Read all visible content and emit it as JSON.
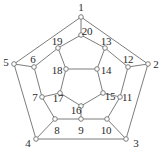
{
  "figure": {
    "name": "dodecahedron-graph",
    "type": "planar-graph-diagram",
    "width": 161,
    "height": 149,
    "background_color": "#ffffff",
    "edge_color": "#6e6e6e",
    "node_fill_color": "#ffffff",
    "node_stroke_color": "#6e6e6e",
    "label_color": "#2b2b2b"
  },
  "nodes": [
    {
      "id": "1",
      "label": "1",
      "x": 81.0,
      "y": 17.0,
      "lx": 81.0,
      "ly": 7.0
    },
    {
      "id": "2",
      "label": "2",
      "x": 148.0,
      "y": 64.0,
      "lx": 156.0,
      "ly": 64.0
    },
    {
      "id": "3",
      "label": "3",
      "x": 126.0,
      "y": 139.0,
      "lx": 136.0,
      "ly": 143.0
    },
    {
      "id": "4",
      "label": "4",
      "x": 36.0,
      "y": 139.0,
      "lx": 28.0,
      "ly": 143.0
    },
    {
      "id": "5",
      "label": "5",
      "x": 14.0,
      "y": 64.0,
      "lx": 6.0,
      "ly": 62.0
    },
    {
      "id": "6",
      "label": "6",
      "x": 34.0,
      "y": 67.0,
      "lx": 33.0,
      "ly": 59.0
    },
    {
      "id": "7",
      "label": "7",
      "x": 42.0,
      "y": 97.0,
      "lx": 35.0,
      "ly": 97.0
    },
    {
      "id": "8",
      "label": "8",
      "x": 55.0,
      "y": 119.0,
      "lx": 57.0,
      "ly": 130.0
    },
    {
      "id": "9",
      "label": "9",
      "x": 81.0,
      "y": 119.0,
      "lx": 81.0,
      "ly": 130.0
    },
    {
      "id": "10",
      "label": "10",
      "x": 107.0,
      "y": 119.0,
      "lx": 106.0,
      "ly": 130.0
    },
    {
      "id": "11",
      "label": "11",
      "x": 120.0,
      "y": 97.0,
      "lx": 127.0,
      "ly": 97.0
    },
    {
      "id": "12",
      "label": "12",
      "x": 128.0,
      "y": 67.0,
      "lx": 128.0,
      "ly": 59.0
    },
    {
      "id": "13",
      "label": "13",
      "x": 105.0,
      "y": 48.0,
      "lx": 106.0,
      "ly": 41.0
    },
    {
      "id": "14",
      "label": "14",
      "x": 97.0,
      "y": 69.0,
      "lx": 106.0,
      "ly": 70.0
    },
    {
      "id": "15",
      "label": "15",
      "x": 103.0,
      "y": 93.0,
      "lx": 110.0,
      "ly": 96.0
    },
    {
      "id": "16",
      "label": "16",
      "x": 81.0,
      "y": 106.0,
      "lx": 76.0,
      "ly": 110.0
    },
    {
      "id": "17",
      "label": "17",
      "x": 60.0,
      "y": 93.0,
      "lx": 58.0,
      "ly": 98.0
    },
    {
      "id": "18",
      "label": "18",
      "x": 66.0,
      "y": 69.0,
      "lx": 57.0,
      "ly": 70.0
    },
    {
      "id": "19",
      "label": "19",
      "x": 58.0,
      "y": 48.0,
      "lx": 57.0,
      "ly": 41.0
    },
    {
      "id": "20",
      "label": "20",
      "x": 81.0,
      "y": 35.0,
      "lx": 87.0,
      "ly": 31.0
    }
  ],
  "edges": [
    {
      "from": "1",
      "to": "5"
    },
    {
      "from": "1",
      "to": "2"
    },
    {
      "from": "1",
      "to": "20"
    },
    {
      "from": "2",
      "to": "3"
    },
    {
      "from": "2",
      "to": "12"
    },
    {
      "from": "3",
      "to": "4"
    },
    {
      "from": "3",
      "to": "10"
    },
    {
      "from": "4",
      "to": "5"
    },
    {
      "from": "4",
      "to": "8"
    },
    {
      "from": "5",
      "to": "6"
    },
    {
      "from": "6",
      "to": "7"
    },
    {
      "from": "6",
      "to": "19"
    },
    {
      "from": "7",
      "to": "8"
    },
    {
      "from": "7",
      "to": "17"
    },
    {
      "from": "8",
      "to": "9"
    },
    {
      "from": "9",
      "to": "10"
    },
    {
      "from": "9",
      "to": "16"
    },
    {
      "from": "10",
      "to": "11"
    },
    {
      "from": "11",
      "to": "12"
    },
    {
      "from": "11",
      "to": "15"
    },
    {
      "from": "12",
      "to": "13"
    },
    {
      "from": "13",
      "to": "20"
    },
    {
      "from": "13",
      "to": "14"
    },
    {
      "from": "14",
      "to": "15"
    },
    {
      "from": "14",
      "to": "18"
    },
    {
      "from": "15",
      "to": "16"
    },
    {
      "from": "16",
      "to": "17"
    },
    {
      "from": "17",
      "to": "18"
    },
    {
      "from": "18",
      "to": "19"
    },
    {
      "from": "19",
      "to": "20"
    }
  ]
}
